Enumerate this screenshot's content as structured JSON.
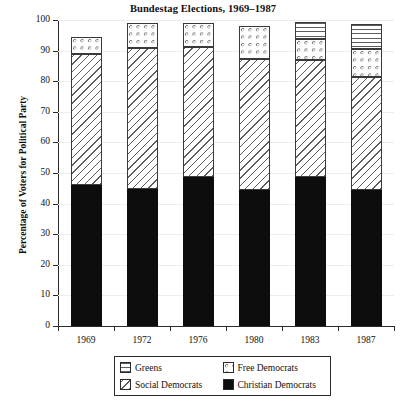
{
  "chart_data": {
    "type": "bar",
    "subtype": "stacked-bar",
    "title": "Bundestag Elections, 1969–1987",
    "xlabel": "",
    "ylabel": "Percentage of Voters for Political Party",
    "categories": [
      "1969",
      "1972",
      "1976",
      "1980",
      "1983",
      "1987"
    ],
    "ylim": [
      0,
      100
    ],
    "yticks": [
      0,
      10,
      20,
      30,
      40,
      50,
      60,
      70,
      80,
      90,
      100
    ],
    "ytick_labels": [
      "0",
      "10",
      "20",
      "30",
      "40",
      "50",
      "60",
      "70",
      "80",
      "90",
      "100"
    ],
    "grid": true,
    "legend_position": "bottom-center",
    "stack_order_bottom_to_top": [
      "Christian Democrats",
      "Social Democrats",
      "Free Democrats",
      "Greens"
    ],
    "series": [
      {
        "name": "Christian Democrats",
        "pattern": "solid-black",
        "values": [
          46.1,
          44.9,
          48.6,
          44.5,
          48.8,
          44.3
        ]
      },
      {
        "name": "Social Democrats",
        "pattern": "diagonal-hatch",
        "values": [
          42.7,
          45.8,
          42.6,
          42.9,
          38.2,
          37.0
        ]
      },
      {
        "name": "Free Democrats",
        "pattern": "dots",
        "values": [
          5.8,
          8.4,
          7.9,
          10.6,
          6.9,
          9.1
        ]
      },
      {
        "name": "Greens",
        "pattern": "horizontal-lines",
        "values": [
          0,
          0,
          0,
          0,
          5.6,
          8.3
        ]
      }
    ],
    "cumulative_tops": [
      [
        46.1,
        88.8,
        94.6,
        94.6
      ],
      [
        44.9,
        90.7,
        99.1,
        99.1
      ],
      [
        48.6,
        91.2,
        99.1,
        99.1
      ],
      [
        44.5,
        87.4,
        98.0,
        98.0
      ],
      [
        48.8,
        87.0,
        93.9,
        99.5
      ],
      [
        44.3,
        81.3,
        90.4,
        98.7
      ]
    ]
  },
  "legend": {
    "items": [
      {
        "label": "Greens",
        "pattern": "horizontal-lines"
      },
      {
        "label": "Free Democrats",
        "pattern": "dots"
      },
      {
        "label": "Social Democrats",
        "pattern": "diagonal-hatch"
      },
      {
        "label": "Christian Democrats",
        "pattern": "solid-black"
      }
    ]
  },
  "colors": {
    "axis": "#2b2b2b",
    "grid": "#ececec",
    "ink": "#5d5d5d",
    "solid_fill": "#0d0d0d",
    "background": "#ffffff"
  },
  "caption": ""
}
